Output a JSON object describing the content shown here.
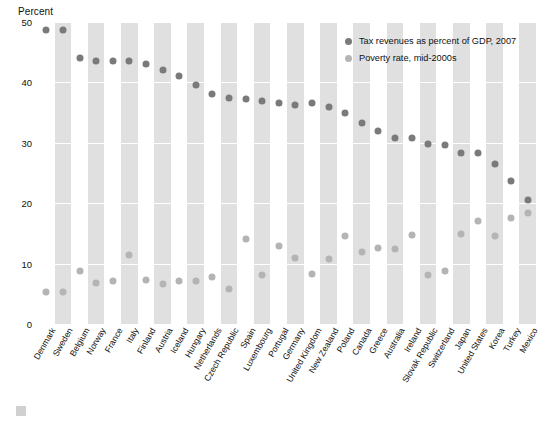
{
  "chart_data": {
    "type": "scatter",
    "title": "",
    "ylabel": "Percent",
    "xlabel": "",
    "ylim": [
      0,
      50
    ],
    "yticks": [
      0,
      10,
      20,
      30,
      40,
      50
    ],
    "grid": true,
    "legend_position": "top-right",
    "categories": [
      "Denmark",
      "Sweden",
      "Belgium",
      "Norway",
      "France",
      "Italy",
      "Finland",
      "Austria",
      "Iceland",
      "Hungary",
      "Netherlands",
      "Czech Republic",
      "Spain",
      "Luxembourg",
      "Portugal",
      "Germany",
      "United Kingdom",
      "New Zealand",
      "Poland",
      "Canada",
      "Greece",
      "Australia",
      "Ireland",
      "Slovak Republic",
      "Switzerland",
      "Japan",
      "United States",
      "Korea",
      "Turkey",
      "Mexico"
    ],
    "series": [
      {
        "name": "Tax revenues as percent of GDP, 2007",
        "color": "#7a7a7a",
        "values": [
          48.7,
          48.7,
          44.0,
          43.6,
          43.6,
          43.5,
          43.0,
          42.1,
          41.0,
          39.5,
          38.0,
          37.4,
          37.2,
          36.9,
          36.6,
          36.2,
          36.6,
          36.0,
          34.9,
          33.3,
          32.0,
          30.8,
          30.8,
          29.8,
          29.7,
          28.3,
          28.3,
          26.5,
          23.7,
          20.5
        ]
      },
      {
        "name": "Poverty rate, mid-2000s",
        "color": "#b4b4b4",
        "values": [
          5.3,
          5.3,
          8.8,
          6.8,
          7.1,
          11.4,
          7.3,
          6.6,
          7.1,
          7.1,
          7.7,
          5.8,
          14.1,
          8.1,
          12.9,
          11.0,
          8.3,
          10.8,
          14.6,
          12.0,
          12.6,
          12.4,
          14.8,
          8.1,
          8.7,
          14.9,
          17.1,
          14.6,
          17.5,
          18.4
        ]
      }
    ]
  },
  "legend": {
    "items": [
      {
        "label": "Tax revenues as percent of GDP, 2007",
        "color": "#7a7a7a"
      },
      {
        "label": "Poverty rate, mid-2000s",
        "color": "#b4b4b4"
      }
    ]
  }
}
